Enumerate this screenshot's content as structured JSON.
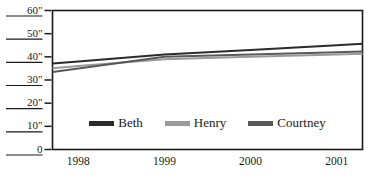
{
  "chart_data": {
    "type": "line",
    "title": "",
    "xlabel": "",
    "ylabel": "",
    "x": [
      1998,
      1999,
      2000,
      2001
    ],
    "categories": [
      "1998",
      "1999",
      "2000",
      "2001"
    ],
    "xtick_labels": [
      "1998",
      "1999",
      "2000",
      "2001"
    ],
    "ytick_labels": [
      "60\"",
      "50\"",
      "40\"",
      "30\"",
      "20\"",
      "10\"",
      "0"
    ],
    "ytick_values": [
      60,
      50,
      40,
      30,
      20,
      10,
      0
    ],
    "ylim": [
      0,
      60
    ],
    "xlim": [
      1997.7,
      2001.3
    ],
    "grid": false,
    "legend_position": "inside-bottom-center",
    "series": [
      {
        "name": "Beth",
        "color": "#2b2b2b",
        "values": [
          38,
          41,
          43,
          45
        ]
      },
      {
        "name": "Henry",
        "color": "#9a9a9a",
        "values": [
          36,
          39,
          40,
          41
        ]
      },
      {
        "name": "Courtney",
        "color": "#595959",
        "values": [
          35,
          40,
          41,
          42
        ]
      }
    ]
  },
  "legend": {
    "items": [
      {
        "label": "Beth",
        "color": "#2b2b2b"
      },
      {
        "label": "Henry",
        "color": "#9a9a9a"
      },
      {
        "label": "Courtney",
        "color": "#595959"
      }
    ]
  },
  "axes": {
    "y_labels": [
      "60\"",
      "50\"",
      "40\"",
      "30\"",
      "20\"",
      "10\"",
      "0"
    ],
    "x_labels": [
      "1998",
      "1999",
      "2000",
      "2001"
    ]
  },
  "colors": {
    "axis": "#1a1a1a",
    "background": "#ffffff",
    "text": "#1a1a1a"
  }
}
